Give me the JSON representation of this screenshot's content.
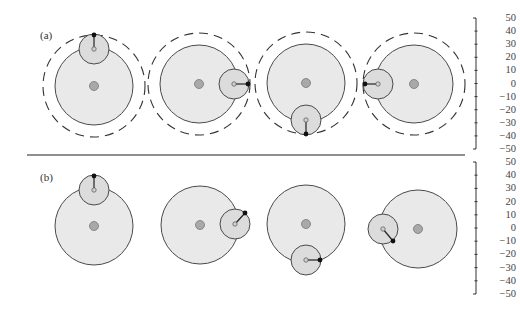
{
  "figure": {
    "panels": [
      {
        "label": "(a)",
        "label_pos": [
          40,
          36
        ],
        "axis": {
          "ticks": [
            "50",
            "40",
            "30",
            "20",
            "10",
            "0",
            "−10",
            "−20",
            "−30",
            "−40",
            "−50"
          ],
          "y_top": 18,
          "y_bottom": 149
        },
        "dashed_orbit": true,
        "items": [
          {
            "big": [
              94,
              86
            ],
            "small": [
              94,
              49
            ],
            "tip": [
              94,
              35
            ]
          },
          {
            "big": [
              199,
              84
            ],
            "small": [
              234,
              84
            ],
            "tip": [
              248,
              84
            ]
          },
          {
            "big": [
              306,
              83
            ],
            "small": [
              306,
              120
            ],
            "tip": [
              306,
              134
            ]
          },
          {
            "big": [
              414,
              84
            ],
            "small": [
              378,
              84
            ],
            "tip": [
              365,
              84
            ]
          }
        ]
      },
      {
        "label": "(b)",
        "label_pos": [
          40,
          178
        ],
        "axis": {
          "ticks": [
            "50",
            "40",
            "30",
            "20",
            "10",
            "0",
            "−10",
            "−20",
            "−30",
            "−40",
            "−50"
          ],
          "y_top": 162,
          "y_bottom": 294
        },
        "dashed_orbit": false,
        "items": [
          {
            "big": [
              94,
              226
            ],
            "small": [
              94,
              190
            ],
            "tip": [
              94,
              176
            ]
          },
          {
            "big": [
              200,
              225
            ],
            "small": [
              235,
              224
            ],
            "tip": [
              245,
              213
            ]
          },
          {
            "big": [
              306,
              224
            ],
            "small": [
              306,
              260
            ],
            "tip": [
              320,
              260
            ]
          },
          {
            "big": [
              418,
              229
            ],
            "small": [
              383,
              229
            ],
            "tip": [
              393,
              241
            ]
          }
        ]
      }
    ],
    "geometry": {
      "big_radius": 39,
      "small_radius": 15,
      "orbit_radius": 51,
      "hub_radius": 4.5,
      "pivot_radius": 2.2,
      "tip_radius": 2.4
    },
    "divider": {
      "x1": 27,
      "x2": 465,
      "y": 155
    },
    "axis_x": 476,
    "colors": {
      "big_fill": "#e9e9e9",
      "small_fill": "#dcdcdc",
      "hub_fill": "#a9a9a9",
      "stroke": "#4a4a4a",
      "tip": "#111111",
      "divider": "#6a6a6a"
    }
  }
}
